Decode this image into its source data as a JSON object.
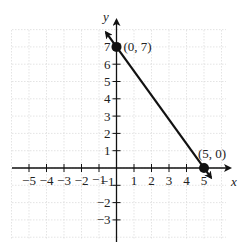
{
  "chart_data": {
    "type": "line",
    "title": "",
    "xlabel": "x",
    "ylabel": "y",
    "xlim": [
      -6,
      6
    ],
    "ylim": [
      -3.5,
      8.5
    ],
    "grid": true,
    "x_ticks": [
      -5,
      -4,
      -3,
      -2,
      -1,
      1,
      2,
      3,
      4,
      5
    ],
    "y_ticks": [
      -3,
      -2,
      -1,
      1,
      2,
      3,
      4,
      5,
      6,
      7
    ],
    "x_tick_labels": [
      "−5",
      "−4",
      "−3",
      "−2",
      "−1",
      "1",
      "2",
      "3",
      "4",
      "5"
    ],
    "y_tick_labels": [
      "−3",
      "−2",
      "−1",
      "1",
      "2",
      "3",
      "4",
      "5",
      "6",
      "7"
    ],
    "series": [
      {
        "name": "line through (0, 7) and (5, 0)",
        "equation": "y = -7/5 x + 7",
        "x": [
          -0.6,
          5.4
        ],
        "y": [
          7.84,
          -0.56
        ],
        "arrows": "both"
      }
    ],
    "points": [
      {
        "x": 0,
        "y": 7,
        "label": "(0, 7)"
      },
      {
        "x": 5,
        "y": 0,
        "label": "(5, 0)"
      }
    ]
  }
}
